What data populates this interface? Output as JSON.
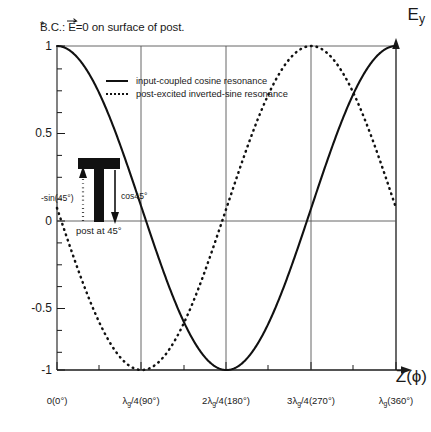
{
  "figure": {
    "note": {
      "star": "*",
      "text_before": "B.C.: ",
      "vector_symbol": "E",
      "text_after": "=0 on surface of post."
    },
    "axes": {
      "y_label": "E",
      "y_label_sub": "y",
      "x_label": "Z(ϕ)"
    }
  },
  "legend": {
    "entries": [
      {
        "style": "solid",
        "label": "input-coupled cosine resonance"
      },
      {
        "style": "dotted",
        "label": "post-excited inverted-sine resonance"
      }
    ]
  },
  "post_annotation": {
    "caption": "post at 45°",
    "left_arrow_label": "-sin(45°)",
    "right_arrow_label": "cos45°"
  },
  "chart_data": {
    "type": "line",
    "title": "",
    "xlabel": "Z(ϕ)",
    "ylabel": "E_y",
    "xlim": [
      0,
      360
    ],
    "ylim": [
      -1,
      1
    ],
    "grid": "vertical gridlines at 90°, 180°, 270°; horizontal reference lines at y=1, y=0, y=-1",
    "legend_position": "inside-top-left",
    "x_ticks": [
      0,
      90,
      180,
      270,
      360
    ],
    "x_tick_labels": [
      "0(0°)",
      "λg/4(90°)",
      "2λg/4(180°)",
      "3λg/4(270°)",
      "λg(360°)"
    ],
    "x_tick_label_parts": [
      {
        "lead": "0",
        "lam": "",
        "sub": "",
        "tail": "(0°)"
      },
      {
        "lead": "",
        "lam": "λ",
        "sub": "g",
        "tail": "/4(90°)"
      },
      {
        "lead": "2",
        "lam": "λ",
        "sub": "g",
        "tail": "/4(180°)"
      },
      {
        "lead": "3",
        "lam": "λ",
        "sub": "g",
        "tail": "/4(270°)"
      },
      {
        "lead": "",
        "lam": "λ",
        "sub": "g",
        "tail": "(360°)"
      }
    ],
    "y_ticks": [
      -1,
      -0.5,
      0,
      0.5,
      1
    ],
    "y_tick_labels": [
      "-1",
      "-0.5",
      "0",
      "0.5",
      "1"
    ],
    "series": [
      {
        "name": "input-coupled cosine resonance",
        "style": "solid",
        "formula": "cos(phi)",
        "x": [
          0,
          10,
          20,
          30,
          40,
          45,
          50,
          60,
          70,
          80,
          90,
          100,
          110,
          120,
          130,
          135,
          140,
          150,
          160,
          170,
          180,
          190,
          200,
          210,
          220,
          225,
          230,
          240,
          250,
          260,
          270,
          280,
          290,
          300,
          310,
          315,
          320,
          330,
          340,
          350,
          360
        ],
        "y": [
          1.0,
          0.985,
          0.94,
          0.866,
          0.766,
          0.707,
          0.643,
          0.5,
          0.342,
          0.174,
          0.0,
          -0.174,
          -0.342,
          -0.5,
          -0.643,
          -0.707,
          -0.766,
          -0.866,
          -0.94,
          -0.985,
          -1.0,
          -0.985,
          -0.94,
          -0.866,
          -0.766,
          -0.707,
          -0.643,
          -0.5,
          -0.342,
          -0.174,
          0.0,
          0.174,
          0.342,
          0.5,
          0.643,
          0.707,
          0.766,
          0.866,
          0.94,
          0.985,
          1.0
        ]
      },
      {
        "name": "post-excited inverted-sine resonance",
        "style": "dotted",
        "formula": "-sin(phi)",
        "x": [
          0,
          10,
          20,
          30,
          40,
          45,
          50,
          60,
          70,
          80,
          90,
          100,
          110,
          120,
          130,
          135,
          140,
          150,
          160,
          170,
          180,
          190,
          200,
          210,
          220,
          225,
          230,
          240,
          250,
          260,
          270,
          280,
          290,
          300,
          310,
          315,
          320,
          330,
          340,
          350,
          360
        ],
        "y": [
          0.0,
          -0.174,
          -0.342,
          -0.5,
          -0.643,
          -0.707,
          -0.766,
          -0.866,
          -0.94,
          -0.985,
          -1.0,
          -0.985,
          -0.94,
          -0.866,
          -0.766,
          -0.707,
          -0.643,
          -0.5,
          -0.342,
          -0.174,
          0.0,
          0.174,
          0.342,
          0.5,
          0.643,
          0.707,
          0.766,
          0.866,
          0.94,
          0.985,
          1.0,
          0.985,
          0.94,
          0.866,
          0.766,
          0.707,
          0.643,
          0.5,
          0.342,
          0.174,
          0.0
        ]
      }
    ],
    "annotations": [
      {
        "text": "*B.C.: E=0 on surface of post.",
        "position": "above-plot-left"
      },
      {
        "text": "post at 45°",
        "position": "x=45°, y=0"
      },
      {
        "text": "-sin(45°)",
        "position": "x=45°, arrow up from 0 to 0.707"
      },
      {
        "text": "cos45°",
        "position": "x=45°, arrow down from 0.707 to 0"
      }
    ]
  }
}
